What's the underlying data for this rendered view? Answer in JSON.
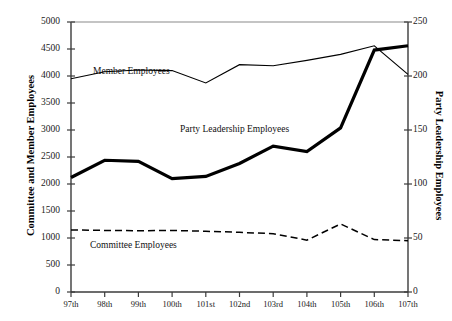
{
  "clipped_header": "",
  "chart_data": {
    "type": "line",
    "title": "",
    "xlabel": "",
    "categories": [
      "97th",
      "98th",
      "99th",
      "100th",
      "101st",
      "102nd",
      "103rd",
      "104th",
      "105th",
      "106th",
      "107th"
    ],
    "grid": false,
    "legend": "inline-annotations",
    "axes": {
      "left": {
        "label": "Committee and Member Employees",
        "min": 0,
        "max": 5000,
        "step": 500,
        "ticks": [
          "0",
          "500",
          "1000",
          "1500",
          "2000",
          "2500",
          "3000",
          "3500",
          "4000",
          "4500",
          "5000"
        ]
      },
      "right": {
        "label": "Party Leadership Employees",
        "min": 0,
        "max": 250,
        "step": 50,
        "ticks": [
          "0",
          "50",
          "100",
          "150",
          "200",
          "250"
        ]
      }
    },
    "series": [
      {
        "name": "Member Employees",
        "axis": "left",
        "style": "solid-thin",
        "color": "#000000",
        "values": [
          3950,
          4080,
          4110,
          4100,
          3870,
          4210,
          4190,
          4290,
          4400,
          4560,
          4030
        ]
      },
      {
        "name": "Party Leadership Employees",
        "axis": "right",
        "style": "solid-thick",
        "color": "#000000",
        "values": [
          106,
          122,
          121,
          105,
          107,
          119,
          135,
          130,
          152,
          224,
          228
        ]
      },
      {
        "name": "Committee Employees",
        "axis": "left",
        "style": "dashed",
        "color": "#000000",
        "values": [
          1150,
          1140,
          1135,
          1140,
          1125,
          1105,
          1080,
          960,
          1260,
          970,
          950
        ]
      }
    ]
  }
}
